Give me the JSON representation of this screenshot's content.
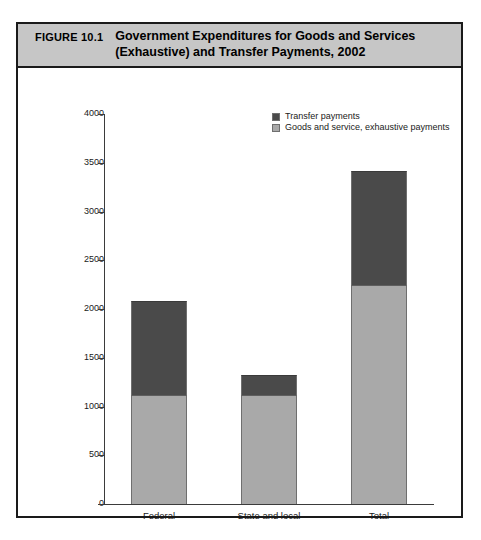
{
  "figure": {
    "label": "FIGURE 10.1",
    "title_line1": "Government Expenditures for Goods and Services",
    "title_line2": "(Exhaustive) and Transfer Payments, 2002"
  },
  "legend": {
    "position": "top-right",
    "items": [
      {
        "label": "Transfer payments",
        "color": "#4a4a4a"
      },
      {
        "label": "Goods and service, exhaustive payments",
        "color": "#a9a9a9"
      }
    ]
  },
  "axis": {
    "y_title": "Billions of dollars",
    "y_ticks": [
      "4000",
      "3500",
      "3000",
      "2500",
      "2000",
      "1500",
      "1000",
      "500",
      "0"
    ],
    "x_ticks": [
      "Federal",
      "State and local",
      "Total"
    ]
  },
  "chart_data": {
    "type": "bar",
    "stacked": true,
    "title": "Government Expenditures for Goods and Services (Exhaustive) and Transfer Payments, 2002",
    "xlabel": "",
    "ylabel": "Billions of dollars",
    "ylim": [
      0,
      4000
    ],
    "ytick_step": 500,
    "grid": false,
    "legend_position": "top-right",
    "categories": [
      "Federal",
      "State and local",
      "Total"
    ],
    "series": [
      {
        "name": "Goods and service, exhaustive payments",
        "color": "#a9a9a9",
        "values": [
          1118,
          1115,
          2246
        ]
      },
      {
        "name": "Transfer payments",
        "color": "#4a4a4a",
        "values": [
          964,
          205,
          1169
        ]
      }
    ],
    "totals": [
      2082,
      1320,
      3415
    ]
  }
}
